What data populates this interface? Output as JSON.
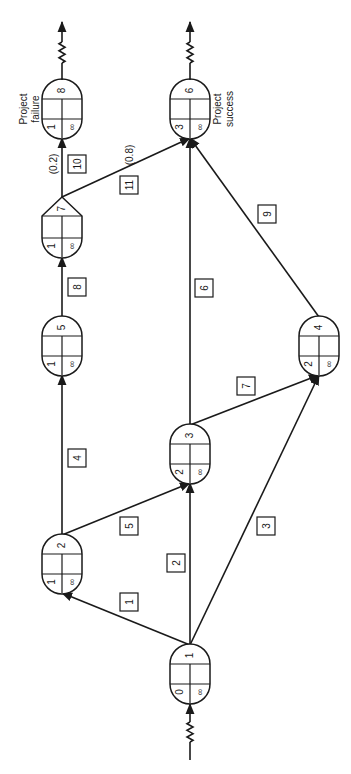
{
  "diagram": {
    "orientation": "rotated 90 degrees counter-clockwise",
    "colors": {
      "line": "#1a1a1a",
      "background": "#ffffff"
    },
    "nodes": [
      {
        "id": "1",
        "label": "1",
        "cx": 190,
        "top": 645,
        "bottom": 703,
        "bottom_left": "0",
        "bottom_right": "∞",
        "shape": "rounded",
        "entry": "start"
      },
      {
        "id": "2",
        "label": "2",
        "cx": 62,
        "top": 535,
        "bottom": 593,
        "bottom_left": "1",
        "bottom_right": "∞",
        "shape": "rounded"
      },
      {
        "id": "3",
        "label": "3",
        "cx": 190,
        "top": 425,
        "bottom": 483,
        "bottom_left": "2",
        "bottom_right": "∞",
        "shape": "rounded"
      },
      {
        "id": "4",
        "label": "4",
        "cx": 319,
        "top": 317,
        "bottom": 375,
        "bottom_left": "2",
        "bottom_right": "∞",
        "shape": "rounded"
      },
      {
        "id": "5",
        "label": "5",
        "cx": 62,
        "top": 317,
        "bottom": 375,
        "bottom_left": "1",
        "bottom_right": "∞",
        "shape": "rounded"
      },
      {
        "id": "7",
        "label": "7",
        "cx": 62,
        "top": 197,
        "bottom": 257,
        "bottom_left": "1",
        "bottom_right": "∞",
        "shape": "triangle"
      },
      {
        "id": "6",
        "label": "6",
        "cx": 190,
        "top": 80,
        "bottom": 138,
        "bottom_left": "3",
        "bottom_right": "∞",
        "shape": "rounded",
        "exit": "end",
        "caption": [
          "Project",
          "success"
        ]
      },
      {
        "id": "8",
        "label": "8",
        "cx": 62,
        "top": 80,
        "bottom": 138,
        "bottom_left": "1",
        "bottom_right": "∞",
        "shape": "rounded",
        "exit": "end",
        "caption": [
          "Project",
          "failure"
        ]
      }
    ],
    "edges": [
      {
        "activity": "1",
        "from": "1",
        "to": "2",
        "label_x": 129,
        "label_y": 602
      },
      {
        "activity": "2",
        "from": "1",
        "to": "3",
        "label_x": 176,
        "label_y": 563
      },
      {
        "activity": "3",
        "from": "1",
        "to": "4",
        "label_x": 266,
        "label_y": 526
      },
      {
        "activity": "4",
        "from": "2",
        "to": "5",
        "label_x": 77,
        "label_y": 458
      },
      {
        "activity": "5",
        "from": "2",
        "to": "3",
        "label_x": 129,
        "label_y": 526
      },
      {
        "activity": "6",
        "from": "3",
        "to": "6",
        "label_x": 204,
        "label_y": 288
      },
      {
        "activity": "7",
        "from": "3",
        "to": "4",
        "label_x": 246,
        "label_y": 386
      },
      {
        "activity": "8",
        "from": "5",
        "to": "7",
        "label_x": 77,
        "label_y": 287
      },
      {
        "activity": "9",
        "from": "4",
        "to": "6",
        "label_x": 267,
        "label_y": 214
      },
      {
        "activity": "10",
        "from": "7",
        "to": "8",
        "label_x": 77,
        "label_y": 164,
        "probability": "(0.2)"
      },
      {
        "activity": "11",
        "from": "7",
        "to": "6",
        "label_x": 129,
        "label_y": 185,
        "probability": "(0.8)"
      }
    ],
    "captions": {
      "success": "Project success",
      "failure": "Project failure"
    }
  }
}
